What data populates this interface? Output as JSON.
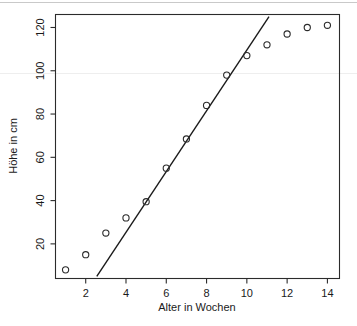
{
  "chart_data": {
    "type": "scatter",
    "title": "",
    "subtitle": "",
    "xlabel": "Alter in Wochen",
    "ylabel": "Höhe in cm",
    "xlim": [
      0.5,
      14.6
    ],
    "ylim": [
      4,
      126
    ],
    "grid": false,
    "legend": null,
    "x": [
      1,
      2,
      3,
      4,
      5,
      6,
      7,
      8,
      9,
      10,
      11,
      12,
      13,
      14
    ],
    "values": [
      8,
      15,
      25,
      32,
      39.5,
      55,
      68.5,
      84,
      98,
      107,
      112,
      117,
      120,
      121
    ],
    "series": [
      {
        "name": "Höhe",
        "marker": "open-circle",
        "x": [
          1,
          2,
          3,
          4,
          5,
          6,
          7,
          8,
          9,
          10,
          11,
          12,
          13,
          14
        ],
        "values": [
          8,
          15,
          25,
          32,
          39.5,
          55,
          68.5,
          84,
          98,
          107,
          112,
          117,
          120,
          121
        ]
      },
      {
        "name": "Regressionsgerade",
        "type": "line",
        "x": [
          2.55,
          11.1
        ],
        "values": [
          5,
          125
        ]
      }
    ],
    "xticks": [
      2,
      4,
      6,
      8,
      10,
      12,
      14
    ],
    "yticks": [
      20,
      40,
      60,
      80,
      100,
      120
    ],
    "xtick_labels": [
      "2",
      "4",
      "6",
      "8",
      "10",
      "12",
      "14"
    ],
    "ytick_labels": [
      "20",
      "40",
      "60",
      "80",
      "100",
      "120"
    ],
    "colors": {
      "axis": "#2b2b2b",
      "point": "#2b2b2b",
      "line": "#1a1a1a",
      "background": "#ffffff"
    }
  }
}
